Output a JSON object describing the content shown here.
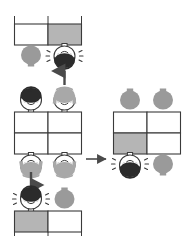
{
  "figure": {
    "title_fragment_top": "   ",
    "background_color": "#ffffff",
    "ink_color": "#3a3a3a",
    "gray_fill": "#b5b5b5",
    "blob_gray": "#9a9a9a",
    "dark_hair": "#2b2b2b",
    "light_hair": "#a8a8a8",
    "arrow_color": "#4a4a4a"
  },
  "panels": {
    "top_left": {
      "name": "result-bar-top",
      "grid": {
        "rows": 1,
        "cols": 2,
        "cells": [
          {
            "row": 0,
            "col": 0,
            "fill": "white"
          },
          {
            "row": 0,
            "col": 1,
            "fill": "gray"
          }
        ]
      },
      "tick_marks_above": 3,
      "characters": [
        {
          "position": "below-left",
          "type": "blob",
          "hair": "gray",
          "face": "none",
          "orientation": "upright",
          "excited": false
        },
        {
          "position": "below-right",
          "type": "face",
          "hair": "dark",
          "face": "happy",
          "orientation": "inverted",
          "excited": true
        }
      ]
    },
    "middle_left": {
      "name": "source-grid-middle-left",
      "grid": {
        "rows": 2,
        "cols": 2,
        "cells": [
          {
            "row": 0,
            "col": 0,
            "fill": "white"
          },
          {
            "row": 0,
            "col": 1,
            "fill": "white"
          },
          {
            "row": 1,
            "col": 0,
            "fill": "white"
          },
          {
            "row": 1,
            "col": 1,
            "fill": "white"
          }
        ]
      },
      "characters": [
        {
          "position": "above-left",
          "type": "face",
          "hair": "dark",
          "face": "happy",
          "orientation": "upright",
          "excited": false
        },
        {
          "position": "above-right",
          "type": "face",
          "hair": "light",
          "face": "happy",
          "orientation": "upright",
          "excited": false
        },
        {
          "position": "below-left",
          "type": "face",
          "hair": "light",
          "face": "happy",
          "orientation": "inverted",
          "excited": false
        },
        {
          "position": "below-right",
          "type": "face",
          "hair": "light",
          "face": "happy",
          "orientation": "inverted",
          "excited": false
        }
      ]
    },
    "middle_right": {
      "name": "result-grid-middle-right",
      "grid": {
        "rows": 2,
        "cols": 2,
        "cells": [
          {
            "row": 0,
            "col": 0,
            "fill": "white"
          },
          {
            "row": 0,
            "col": 1,
            "fill": "white"
          },
          {
            "row": 1,
            "col": 0,
            "fill": "gray"
          },
          {
            "row": 1,
            "col": 1,
            "fill": "white"
          }
        ]
      },
      "characters": [
        {
          "position": "above-left",
          "type": "blob",
          "hair": "gray",
          "face": "none",
          "orientation": "upright",
          "excited": false
        },
        {
          "position": "above-right",
          "type": "blob",
          "hair": "gray",
          "face": "none",
          "orientation": "upright",
          "excited": false
        },
        {
          "position": "below-left",
          "type": "face",
          "hair": "dark",
          "face": "happy",
          "orientation": "inverted",
          "excited": true
        },
        {
          "position": "below-right",
          "type": "blob",
          "hair": "gray",
          "face": "none",
          "orientation": "upright",
          "excited": false
        }
      ]
    },
    "bottom_left": {
      "name": "result-bar-bottom",
      "grid": {
        "rows": 1,
        "cols": 2,
        "cells": [
          {
            "row": 0,
            "col": 0,
            "fill": "gray"
          },
          {
            "row": 0,
            "col": 1,
            "fill": "white"
          }
        ]
      },
      "tick_marks_below": 3,
      "characters": [
        {
          "position": "above-left",
          "type": "face",
          "hair": "dark",
          "face": "happy",
          "orientation": "upright",
          "excited": true
        },
        {
          "position": "above-right",
          "type": "blob",
          "hair": "gray",
          "face": "none",
          "orientation": "upright",
          "excited": false
        }
      ]
    }
  },
  "arrows": [
    {
      "name": "arrow-up",
      "direction": "up",
      "from": "middle_left",
      "to": "top_left"
    },
    {
      "name": "arrow-right",
      "direction": "right",
      "from": "middle_left",
      "to": "middle_right"
    },
    {
      "name": "arrow-down",
      "direction": "down",
      "from": "middle_left",
      "to": "bottom_left"
    }
  ]
}
